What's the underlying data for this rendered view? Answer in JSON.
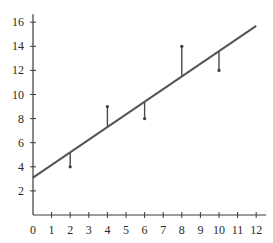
{
  "chart_data": {
    "type": "scatter",
    "title": "",
    "xlabel": "",
    "ylabel": "",
    "xlim": [
      0,
      12
    ],
    "ylim": [
      0,
      16
    ],
    "grid": false,
    "x_ticks": [
      0,
      1,
      2,
      3,
      4,
      5,
      6,
      7,
      8,
      9,
      10,
      11,
      12
    ],
    "y_ticks": [
      2,
      4,
      6,
      8,
      10,
      12,
      14,
      16
    ],
    "points": [
      {
        "x": 2,
        "y": 4
      },
      {
        "x": 4,
        "y": 9
      },
      {
        "x": 6,
        "y": 8
      },
      {
        "x": 8,
        "y": 14
      },
      {
        "x": 10,
        "y": 12
      }
    ],
    "regression_line": {
      "intercept": 3.1,
      "slope": 1.05,
      "x_start": 0,
      "x_end": 12
    },
    "residuals_shown": true,
    "colors": {
      "axis": "#3a3a3a",
      "line": "#555555",
      "residual": "#4a4a4a"
    }
  }
}
